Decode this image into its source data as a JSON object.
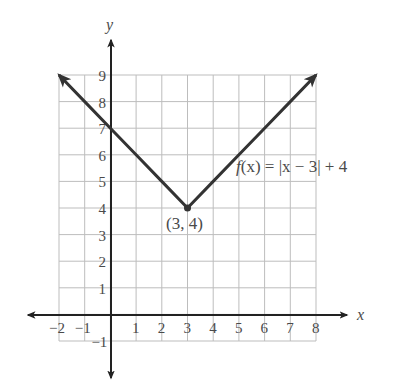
{
  "chart_data": {
    "type": "line",
    "title": "",
    "function_label": "f(x) = |x − 3| + 4",
    "xlabel": "x",
    "ylabel": "y",
    "xlim": [
      -2,
      8
    ],
    "ylim": [
      -1,
      9
    ],
    "grid": true,
    "x_ticks": [
      -2,
      -1,
      1,
      2,
      3,
      4,
      5,
      6,
      7,
      8
    ],
    "y_ticks": [
      -1,
      1,
      2,
      3,
      4,
      5,
      6,
      7,
      8,
      9
    ],
    "x_tick_labels": [
      "−2",
      "−1",
      "1",
      "2",
      "3",
      "4",
      "5",
      "6",
      "7",
      "8"
    ],
    "y_tick_labels": [
      "−1",
      "1",
      "2",
      "3",
      "4",
      "5",
      "6",
      "7",
      "8",
      "9"
    ],
    "series": [
      {
        "name": "f(x) = |x − 3| + 4",
        "x": [
          -2,
          -1,
          0,
          1,
          2,
          3,
          4,
          5,
          6,
          7,
          8
        ],
        "y": [
          9,
          8,
          7,
          6,
          5,
          4,
          5,
          6,
          7,
          8,
          9
        ],
        "arrows_at_ends": true
      }
    ],
    "annotations": [
      {
        "text": "(3, 4)",
        "x": 3,
        "y": 4,
        "type": "vertex-point"
      },
      {
        "text": "f(x) = |x − 3| + 4",
        "x": 5.3,
        "y": 6.3,
        "type": "function-label"
      }
    ],
    "colors": {
      "curve": "#333333",
      "axes": "#222222",
      "grid": "#bdbdbd",
      "text": "#4a4a4a"
    }
  },
  "labels": {
    "x_axis": "x",
    "y_axis": "y",
    "vertex": "(3, 4)",
    "function_f": "f",
    "function_rest": "(x) = |x − 3| + 4"
  }
}
